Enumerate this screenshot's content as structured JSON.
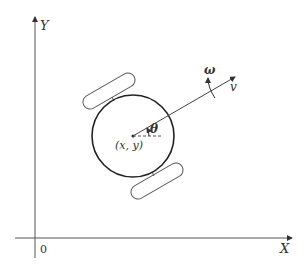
{
  "diagram": {
    "type": "differential-drive robot kinematics",
    "axes": {
      "x_label": "X",
      "y_label": "Y",
      "origin_label": "0"
    },
    "robot": {
      "center_label": "(x, y)",
      "heading_angle_label": "θ",
      "linear_velocity_label": "v",
      "angular_velocity_label": "ω"
    },
    "colors": {
      "stroke": "#333333",
      "axis": "#555555",
      "background": "#ffffff"
    }
  }
}
